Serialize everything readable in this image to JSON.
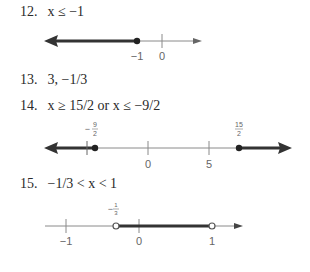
{
  "problems": [
    {
      "number": "12.",
      "answer": "x ≤ −1",
      "number_line": {
        "ticks": [
          {
            "label": "−1",
            "value": -1
          },
          {
            "label": "0",
            "value": 0
          }
        ],
        "shaded": "x ≤ −1",
        "endpoints": [
          {
            "value": -1,
            "type": "closed"
          }
        ],
        "arrows": [
          "left"
        ]
      }
    },
    {
      "number": "13.",
      "answer": "3, −1/3"
    },
    {
      "number": "14.",
      "answer": "x ≥ 15/2 or x ≤ −9/2",
      "number_line": {
        "ticks": [
          {
            "label": "0",
            "value": 0
          },
          {
            "label": "5",
            "value": 5
          }
        ],
        "point_labels": [
          {
            "label": "−9/2",
            "numerator": "9",
            "denominator": "2",
            "sign": "−",
            "value": -4.5
          },
          {
            "label": "15/2",
            "numerator": "15",
            "denominator": "2",
            "sign": "",
            "value": 7.5
          }
        ],
        "endpoints": [
          {
            "value": -4.5,
            "type": "closed"
          },
          {
            "value": 7.5,
            "type": "closed"
          }
        ],
        "arrows": [
          "left",
          "right"
        ]
      }
    },
    {
      "number": "15.",
      "answer": "−1/3 < x < 1",
      "number_line": {
        "ticks": [
          {
            "label": "−1",
            "value": -1
          },
          {
            "label": "0",
            "value": 0
          },
          {
            "label": "1",
            "value": 1
          }
        ],
        "point_labels": [
          {
            "label": "−1/3",
            "numerator": "1",
            "denominator": "3",
            "sign": "−",
            "value": -0.3333
          }
        ],
        "endpoints": [
          {
            "value": -0.3333,
            "type": "open"
          },
          {
            "value": 1,
            "type": "open"
          }
        ],
        "arrows": []
      }
    }
  ],
  "colors": {
    "shaded": "#333333",
    "axis": "#8a8a8a",
    "text": "#2a2a2a"
  }
}
